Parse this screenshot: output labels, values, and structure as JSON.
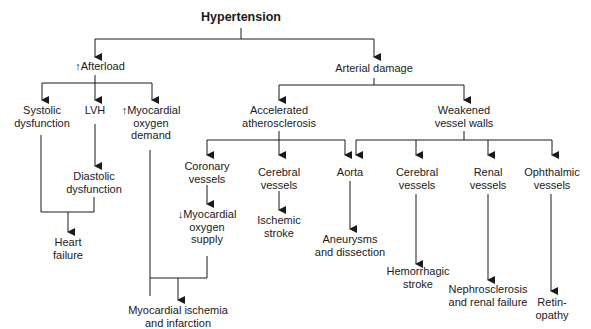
{
  "title": "Hypertension",
  "nodes": {
    "afterload": "↑Afterload",
    "arterial_damage": "Arterial damage",
    "systolic": "Systolic\ndysfunction",
    "lvh": "LVH",
    "myo_demand": "↑Myocardial\noxygen\ndemand",
    "diastolic": "Diastolic\ndysfunction",
    "heart_failure": "Heart\nfailure",
    "accelerated": "Accelerated\natherosclerosis",
    "weakened": "Weakened\nvessel walls",
    "coronary": "Coronary\nvessels",
    "cerebral_a": "Cerebral\nvessels",
    "aorta": "Aorta",
    "cerebral_b": "Cerebral\nvessels",
    "renal": "Renal\nvessels",
    "ophthalmic": "Ophthalmic\nvessels",
    "myo_supply": "↓Myocardial\noxygen\nsupply",
    "ischemic_stroke": "Ischemic\nstroke",
    "aneurysms": "Aneurysms\nand dissection",
    "hemorrhagic": "Hemorrhagic\nstroke",
    "nephrosclerosis": "Nephrosclerosis\nand renal failure",
    "retinopathy": "Retin-\nopathy",
    "myo_ischemia": "Myocardial ischemia\nand infarction"
  },
  "style": {
    "line_color": "#1a1a1a",
    "text_color": "#1a1a1a",
    "background": "#ffffff"
  }
}
